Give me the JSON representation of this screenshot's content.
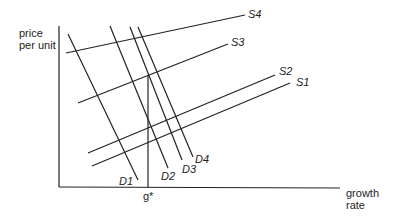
{
  "diagram": {
    "y_axis_label_line1": "price",
    "y_axis_label_line2": "per unit",
    "x_axis_label_line1": "growth",
    "x_axis_label_line2": "rate",
    "marker_label": "g*",
    "supply_labels": [
      "S1",
      "S2",
      "S3",
      "S4"
    ],
    "demand_labels": [
      "D1",
      "D2",
      "D3",
      "D4"
    ],
    "line_color": "#222222"
  }
}
